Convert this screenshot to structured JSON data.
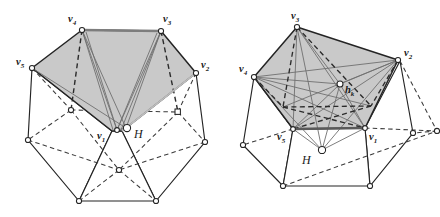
{
  "figure": {
    "background_color": "#ffffff",
    "face_fill_color": "#c9c9c9",
    "solid_edge_color": "#242424",
    "dashed_edge_color": "#3a3a3a",
    "thin_line_color": "#6f6f6f",
    "vertex_marker_fill": "#ffffff",
    "vertex_marker_stroke": "#242424"
  },
  "left_figure": {
    "name": "left-polyhedron",
    "labels": {
      "v1": {
        "base": "v",
        "sub": "1",
        "x": 101,
        "y": 129
      },
      "v2": {
        "base": "v",
        "sub": "2",
        "x": 203,
        "y": 70
      },
      "v3": {
        "base": "v",
        "sub": "3",
        "x": 160,
        "y": 18
      },
      "v4": {
        "base": "v",
        "sub": "4",
        "x": 80,
        "y": 18
      },
      "v5": {
        "base": "v",
        "sub": "5",
        "x": 22,
        "y": 66
      },
      "H": {
        "base": "H",
        "sub": "",
        "x": 135,
        "y": 131
      }
    }
  },
  "right_figure": {
    "name": "right-polyhedron",
    "labels": {
      "v1": {
        "base": "v",
        "sub": "1",
        "x": 372,
        "y": 131
      },
      "v2": {
        "base": "v",
        "sub": "2",
        "x": 411,
        "y": 58
      },
      "v3": {
        "base": "v",
        "sub": "3",
        "x": 316,
        "y": 17
      },
      "v4": {
        "base": "v",
        "sub": "4",
        "x": 242,
        "y": 74
      },
      "v5": {
        "base": "v",
        "sub": "5",
        "x": 281,
        "y": 133
      },
      "hk": {
        "base": "h",
        "sub": "k",
        "x": 345,
        "y": 88
      },
      "H": {
        "base": "H",
        "sub": "",
        "x": 318,
        "y": 156
      }
    }
  }
}
